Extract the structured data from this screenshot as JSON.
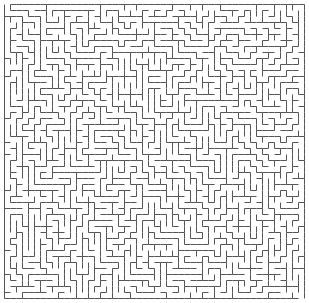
{
  "maze": {
    "title": "Maze",
    "cols": 50,
    "rows": 49,
    "origin_x": 4,
    "origin_y": 4,
    "cell_size": 6,
    "wall_color": "#555555",
    "background_color": "#ffffff",
    "entrance": {
      "side": "top",
      "col": 0
    },
    "exit": {
      "side": "bottom",
      "col": 49
    },
    "seed": 1337
  }
}
